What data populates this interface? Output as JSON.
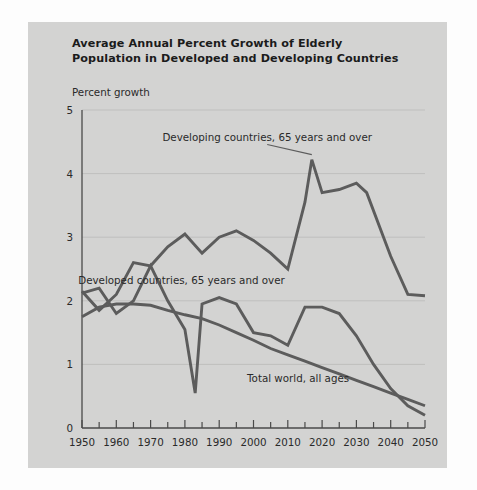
{
  "figure": {
    "title_line1": "Average Annual Percent Growth of Elderly",
    "title_line2": "Population in Developed and Developing Countries",
    "panel_color": "#d3d3d2",
    "line_color": "#5c5c5c",
    "grid_color": "#bfbfbe"
  },
  "chart_data": {
    "type": "line",
    "title": "Average Annual Percent Growth of Elderly Population in Developed and Developing Countries",
    "xlabel": "",
    "ylabel": "Percent growth",
    "ylabel_position": "above-axis",
    "xlim": [
      1950,
      2050
    ],
    "ylim": [
      0,
      5
    ],
    "ytick_values": [
      0,
      1,
      2,
      3,
      4,
      5
    ],
    "ytick_labels": [
      "0",
      "1",
      "2",
      "3",
      "4",
      "5"
    ],
    "xtick_values": [
      1950,
      1960,
      1970,
      1980,
      1990,
      2000,
      2010,
      2020,
      2030,
      2040,
      2050
    ],
    "xtick_labels": [
      "1950",
      "1960",
      "1970",
      "1980",
      "1990",
      "2000",
      "2010",
      "2020",
      "2030",
      "2040",
      "2050"
    ],
    "minor_xtick_interval": 5,
    "grid": "horizontal",
    "legend": "inline-annotations",
    "series": [
      {
        "name": "Developing countries, 65 years and over",
        "label": "Developing countries, 65 years and over",
        "label_x": 2004,
        "label_y": 4.52,
        "leader_to": [
          2017,
          4.22
        ],
        "x": [
          1950,
          1955,
          1960,
          1965,
          1970,
          1975,
          1980,
          1985,
          1990,
          1995,
          2000,
          2005,
          2010,
          2015,
          2017,
          2020,
          2025,
          2030,
          2033,
          2040,
          2045,
          2050
        ],
        "y": [
          2.15,
          1.85,
          2.1,
          2.6,
          2.55,
          2.85,
          3.05,
          2.75,
          3.0,
          3.1,
          2.95,
          2.75,
          2.5,
          3.55,
          4.22,
          3.7,
          3.75,
          3.85,
          3.7,
          2.7,
          2.1,
          2.08
        ]
      },
      {
        "name": "Developed countries, 65 years and over",
        "label": "Developed countries, 65 years and over",
        "label_x": 1979,
        "label_y": 2.27,
        "x": [
          1950,
          1955,
          1960,
          1965,
          1970,
          1975,
          1980,
          1983,
          1985,
          1990,
          1995,
          2000,
          2005,
          2010,
          2015,
          2020,
          2025,
          2030,
          2035,
          2040,
          2045,
          2050
        ],
        "y": [
          2.12,
          2.2,
          1.8,
          2.0,
          2.55,
          2.0,
          1.55,
          0.55,
          1.95,
          2.05,
          1.95,
          1.5,
          1.45,
          1.3,
          1.9,
          1.9,
          1.8,
          1.45,
          1.0,
          0.62,
          0.35,
          0.2
        ]
      },
      {
        "name": "Total world, all ages",
        "label": "Total world, all ages",
        "label_x": 2013,
        "label_y": 0.72,
        "x": [
          1950,
          1955,
          1960,
          1965,
          1970,
          1975,
          1980,
          1985,
          1990,
          1995,
          2000,
          2005,
          2010,
          2015,
          2020,
          2025,
          2030,
          2035,
          2040,
          2045,
          2050
        ],
        "y": [
          1.75,
          1.9,
          1.95,
          1.95,
          1.93,
          1.85,
          1.78,
          1.72,
          1.62,
          1.5,
          1.38,
          1.25,
          1.15,
          1.05,
          0.95,
          0.85,
          0.75,
          0.65,
          0.55,
          0.45,
          0.35
        ]
      }
    ]
  }
}
